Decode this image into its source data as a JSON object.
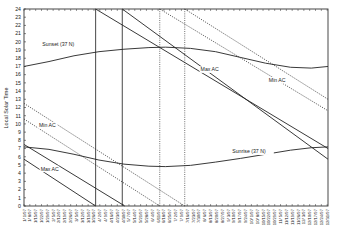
{
  "chart_data": {
    "type": "line",
    "title": "",
    "xlabel": "",
    "ylabel": "Local Solar Time",
    "ylim": [
      0,
      24
    ],
    "xlim_days": [
      0,
      365
    ],
    "y_ticks": [
      0,
      1,
      2,
      3,
      4,
      5,
      6,
      7,
      8,
      9,
      10,
      11,
      12,
      13,
      14,
      15,
      16,
      17,
      18,
      19,
      20,
      21,
      22,
      23,
      24
    ],
    "x_tick_labels": [
      "1/ 1/97",
      "1/ 8/97",
      "1/15/97",
      "1/22/97",
      "1/29/97",
      "2/ 5/97",
      "2/12/97",
      "2/19/97",
      "2/26/97",
      "3/ 5/97",
      "3/12/97",
      "3/19/97",
      "3/26/97",
      "4/ 2/97",
      "4/ 9/97",
      "4/16/97",
      "4/23/97",
      "4/30/97",
      "5/ 7/97",
      "5/14/97",
      "5/21/97",
      "5/28/97",
      "6/ 4/97",
      "6/11/97",
      "6/18/97",
      "6/25/97",
      "7/ 2/97",
      "7/ 9/97",
      "7/16/97",
      "7/23/97",
      "7/30/97",
      "8/ 6/97",
      "8/13/97",
      "8/20/97",
      "8/27/97",
      "9/ 3/97",
      "9/10/97",
      "9/17/97",
      "9/24/97",
      "10/ 1/97",
      "10/ 8/97",
      "10/15/97",
      "10/22/97",
      "10/29/97",
      "11/ 5/97",
      "11/12/97",
      "11/19/97",
      "11/26/97",
      "12/ 3/97",
      "12/10/97",
      "12/17/97",
      "12/24/97",
      "12/31/97"
    ],
    "grid": false,
    "series": [
      {
        "name": "Sunset (37 N)",
        "style": "solid",
        "points": [
          [
            0,
            17.0
          ],
          [
            30,
            17.6
          ],
          [
            60,
            18.3
          ],
          [
            90,
            18.8
          ],
          [
            120,
            19.1
          ],
          [
            150,
            19.3
          ],
          [
            170,
            19.35
          ],
          [
            200,
            19.2
          ],
          [
            230,
            18.8
          ],
          [
            260,
            18.1
          ],
          [
            290,
            17.4
          ],
          [
            320,
            16.9
          ],
          [
            345,
            16.8
          ],
          [
            365,
            17.0
          ]
        ]
      },
      {
        "name": "Sunrise (37 N)",
        "style": "solid",
        "points": [
          [
            0,
            7.2
          ],
          [
            30,
            6.9
          ],
          [
            60,
            6.3
          ],
          [
            90,
            5.6
          ],
          [
            120,
            5.1
          ],
          [
            150,
            4.85
          ],
          [
            170,
            4.8
          ],
          [
            200,
            4.95
          ],
          [
            230,
            5.35
          ],
          [
            260,
            5.8
          ],
          [
            290,
            6.3
          ],
          [
            320,
            6.8
          ],
          [
            345,
            7.1
          ],
          [
            365,
            7.2
          ]
        ]
      },
      {
        "name": "Max AC",
        "style": "solid",
        "points": [
          [
            0,
            7.5
          ],
          [
            121,
            0
          ]
        ]
      },
      {
        "name": "Max AC",
        "style": "solid",
        "points": [
          [
            0,
            5.7
          ],
          [
            86,
            0
          ]
        ]
      },
      {
        "name": "Max AC",
        "style": "solid",
        "points": [
          [
            86,
            24
          ],
          [
            365,
            7.0
          ]
        ]
      },
      {
        "name": "Max AC",
        "style": "solid",
        "points": [
          [
            118,
            24
          ],
          [
            365,
            5.7
          ]
        ]
      },
      {
        "name": "Min AC",
        "style": "dotted",
        "points": [
          [
            0,
            12.5
          ],
          [
            193,
            0
          ]
        ]
      },
      {
        "name": "Min AC",
        "style": "dotted",
        "points": [
          [
            0,
            10.6
          ],
          [
            163,
            0
          ]
        ]
      },
      {
        "name": "Min AC",
        "style": "dotted",
        "points": [
          [
            163,
            24
          ],
          [
            365,
            11.6
          ]
        ]
      },
      {
        "name": "Min AC",
        "style": "dotted",
        "points": [
          [
            193,
            24
          ],
          [
            365,
            13.0
          ]
        ]
      }
    ],
    "vertical_lines": [
      {
        "day": 86,
        "style": "solid"
      },
      {
        "day": 118,
        "style": "solid"
      },
      {
        "day": 163,
        "style": "dotted"
      },
      {
        "day": 193,
        "style": "dotted"
      }
    ],
    "annotations": [
      {
        "text": "Sunset (37 N)",
        "day": 22,
        "value": 19.5
      },
      {
        "text": "Sunrise (37 N)",
        "day": 250,
        "value": 6.4
      },
      {
        "text": "Max AC",
        "day": 20,
        "value": 4.3
      },
      {
        "text": "Max AC",
        "day": 212,
        "value": 16.4
      },
      {
        "text": "Min AC",
        "day": 18,
        "value": 9.6
      },
      {
        "text": "Min AC",
        "day": 294,
        "value": 15.1
      }
    ]
  }
}
